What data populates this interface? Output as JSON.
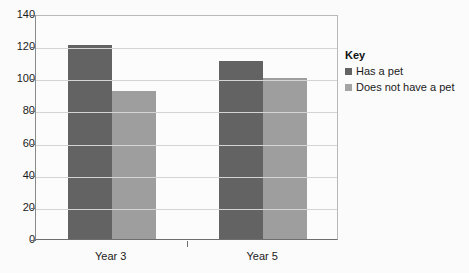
{
  "chart_data": {
    "type": "bar",
    "title": "",
    "xlabel": "",
    "ylabel": "",
    "categories": [
      "Year 3",
      "Year 5"
    ],
    "series": [
      {
        "name": "Has a pet",
        "values": [
          121,
          111
        ],
        "color": "#636363"
      },
      {
        "name": "Does not have a pet",
        "values": [
          92,
          100
        ],
        "color": "#9e9e9e"
      }
    ],
    "ylim": [
      0,
      140
    ],
    "ytick_values": [
      0,
      20,
      40,
      60,
      80,
      100,
      120,
      140
    ],
    "ytick_labels": [
      "0",
      "20",
      "40",
      "60",
      "80",
      "100",
      "120",
      "140"
    ],
    "grid": true,
    "legend_position": "right"
  },
  "legend": {
    "title": "Key",
    "entries": [
      {
        "label": "Has a pet",
        "swatch": "legend-swatch-has-a-pet"
      },
      {
        "label": "Does not have a pet",
        "swatch": "legend-swatch-does-not-have-a-pet"
      }
    ]
  },
  "colors": {
    "series_dark": "#636363",
    "series_light": "#9e9e9e",
    "gridline": "#d4d4d4",
    "axis": "#6e6e6e",
    "background": "#fbfbfb",
    "text": "#1a1a1a"
  }
}
